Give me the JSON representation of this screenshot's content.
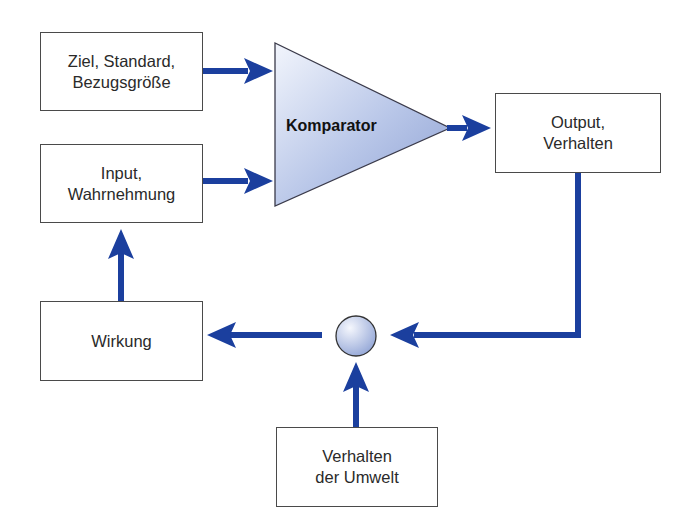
{
  "diagram": {
    "colors": {
      "arrow": "#1b3f9e",
      "box_border": "#4a4a4a",
      "comparator_fill_light": "#eef2fb",
      "comparator_fill_dark": "#93a6d6",
      "node_fill": "#c9d4ee"
    },
    "nodes": {
      "goal": {
        "label": "Ziel, Standard,\nBezugsgröße"
      },
      "input": {
        "label": "Input,\nWahrnehmung"
      },
      "comparator": {
        "label": "Komparator"
      },
      "output": {
        "label": "Output,\nVerhalten"
      },
      "effect": {
        "label": "Wirkung"
      },
      "environment": {
        "label": "Verhalten\nder Umwelt"
      },
      "junction": {
        "label": ""
      }
    },
    "edges": [
      {
        "from": "Ziel, Standard, Bezugsgröße",
        "to": "Komparator"
      },
      {
        "from": "Input, Wahrnehmung",
        "to": "Komparator"
      },
      {
        "from": "Komparator",
        "to": "Output, Verhalten"
      },
      {
        "from": "Output, Verhalten",
        "to": "junction"
      },
      {
        "from": "Verhalten der Umwelt",
        "to": "junction"
      },
      {
        "from": "junction",
        "to": "Wirkung"
      },
      {
        "from": "Wirkung",
        "to": "Input, Wahrnehmung"
      }
    ]
  }
}
